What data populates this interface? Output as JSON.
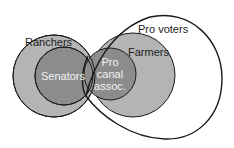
{
  "diagram": {
    "type": "venn",
    "sets": [
      {
        "id": "ranchers",
        "label": "Ranchers",
        "fill": "#b4b4b4"
      },
      {
        "id": "senators",
        "label": "Senators",
        "fill": "#8c8c8c"
      },
      {
        "id": "farmers",
        "label": "Farmers",
        "fill": "#b4b4b4"
      },
      {
        "id": "pro_canal",
        "label_lines": [
          "Pro",
          "canal",
          "assoc."
        ],
        "fill": "#8c8c8c"
      },
      {
        "id": "pro_voters",
        "label": "Pro voters",
        "fill": "none"
      }
    ],
    "colors": {
      "outline": "#1a1a1a",
      "dark_label": "#222222",
      "light_label": "#f2f2f2"
    }
  }
}
